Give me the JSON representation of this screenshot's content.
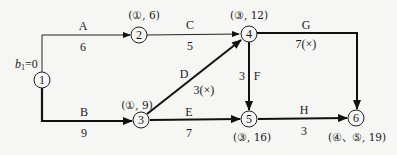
{
  "diagram": {
    "type": "network-shortest-path",
    "start_label": "b1=0",
    "start_label_main": "b",
    "start_label_sub": "1",
    "start_label_rest": "=0",
    "nodes": [
      {
        "id": "1",
        "label": "1"
      },
      {
        "id": "2",
        "label": "2",
        "annotation": "(①, 6)"
      },
      {
        "id": "3",
        "label": "3",
        "annotation": "(①, 9)"
      },
      {
        "id": "4",
        "label": "4",
        "annotation": "(③, 12)"
      },
      {
        "id": "5",
        "label": "5",
        "annotation": "(③, 16)"
      },
      {
        "id": "6",
        "label": "6",
        "annotation": "(④、⑤, 19)"
      }
    ],
    "edges": [
      {
        "name": "A",
        "from": "1",
        "to": "2",
        "weight": "6",
        "bold": false
      },
      {
        "name": "B",
        "from": "1",
        "to": "3",
        "weight": "9",
        "bold": true
      },
      {
        "name": "C",
        "from": "2",
        "to": "4",
        "weight": "5",
        "bold": false
      },
      {
        "name": "D",
        "from": "3",
        "to": "4",
        "weight": "3(×)",
        "bold": true
      },
      {
        "name": "E",
        "from": "3",
        "to": "5",
        "weight": "7",
        "bold": true
      },
      {
        "name": "F",
        "from": "4",
        "to": "5",
        "weight": "3",
        "bold": true
      },
      {
        "name": "G",
        "from": "4",
        "to": "6",
        "weight": "7(×)",
        "bold": true
      },
      {
        "name": "H",
        "from": "5",
        "to": "6",
        "weight": "3",
        "bold": true
      }
    ]
  }
}
